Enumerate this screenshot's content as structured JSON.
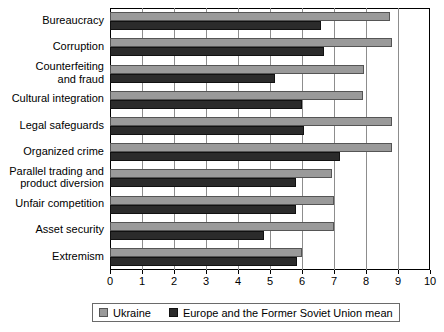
{
  "chart_data": {
    "type": "bar",
    "orientation": "horizontal",
    "title": "",
    "xlabel": "",
    "ylabel": "",
    "xlim": [
      0,
      10
    ],
    "xticks": [
      0,
      1,
      2,
      3,
      4,
      5,
      6,
      7,
      8,
      9,
      10
    ],
    "grid": true,
    "grid_axis": "x",
    "legend_position": "bottom",
    "categories": [
      "Bureaucracy",
      "Corruption",
      "Counterfeiting\nand fraud",
      "Cultural integration",
      "Legal safeguards",
      "Organized crime",
      "Parallel trading and\nproduct diversion",
      "Unfair competition",
      "Asset security",
      "Extremism"
    ],
    "series": [
      {
        "name": "Ukraine",
        "color": "#9a9a9a",
        "values": [
          8.75,
          8.8,
          7.95,
          7.9,
          8.8,
          8.8,
          6.95,
          7.0,
          7.0,
          6.0
        ]
      },
      {
        "name": "Europe and the Former Soviet Union mean",
        "color": "#2b2b2b",
        "values": [
          6.6,
          6.7,
          5.15,
          6.0,
          6.05,
          7.2,
          5.8,
          5.8,
          4.8,
          5.85
        ]
      }
    ]
  },
  "legend": {
    "items": [
      {
        "label": "Ukraine",
        "swatch": "ukraine"
      },
      {
        "label": "Europe and the Former Soviet Union mean",
        "swatch": "eurmean"
      }
    ]
  },
  "axis": {
    "tick_labels": [
      "0",
      "1",
      "2",
      "3",
      "4",
      "5",
      "6",
      "7",
      "8",
      "9",
      "10"
    ]
  }
}
